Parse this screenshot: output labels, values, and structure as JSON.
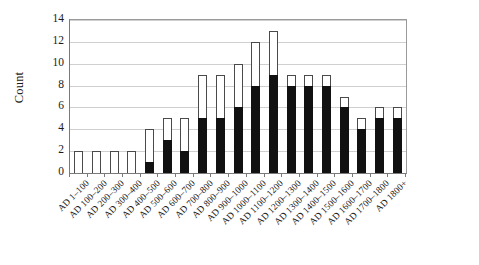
{
  "chart_data": {
    "type": "bar",
    "title": "",
    "subtitle": "",
    "xlabel": "",
    "ylabel": "Count",
    "ylim": [
      0,
      14
    ],
    "yticks": [
      0,
      2,
      4,
      6,
      8,
      10,
      12,
      14
    ],
    "grid": true,
    "legend": "none",
    "stacked": true,
    "orientation": "vertical",
    "categories": [
      "AD 1–100",
      "AD 100–200",
      "AD 200–300",
      "AD 300–400",
      "AD 400–500",
      "AD 500–600",
      "AD 600–700",
      "AD 700–800",
      "AD 800–900",
      "AD 900–1000",
      "AD 1000–1100",
      "AD 1100–1200",
      "AD 1200–1300",
      "AD 1300–1400",
      "AD 1400–1500",
      "AD 1500–1600",
      "AD 1600–1700",
      "AD 1700–1800",
      "AD 1800+"
    ],
    "series": [
      {
        "name": "filled",
        "color": "#111111",
        "values": [
          0,
          0,
          0,
          0,
          1,
          3,
          2,
          5,
          5,
          6,
          8,
          9,
          8,
          8,
          8,
          6,
          4,
          5,
          5
        ]
      },
      {
        "name": "open",
        "color": "#ffffff",
        "values": [
          2,
          2,
          2,
          2,
          3,
          2,
          3,
          4,
          4,
          4,
          4,
          4,
          1,
          1,
          1,
          1,
          1,
          1,
          1
        ]
      }
    ],
    "totals": [
      2,
      2,
      2,
      2,
      4,
      5,
      5,
      9,
      9,
      10,
      12,
      13,
      9,
      9,
      9,
      7,
      5,
      6,
      6
    ]
  }
}
